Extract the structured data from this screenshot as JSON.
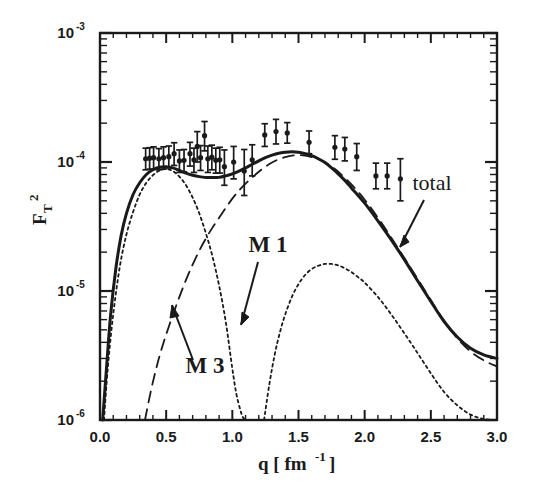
{
  "figure": {
    "background": "#ffffff",
    "ink_color": "#1a1a1a"
  },
  "axes": {
    "x_title_q": "q [ fm",
    "x_title_exp": "-1",
    "x_title_close": "]",
    "y_title_base": "F",
    "y_title_sub": "T",
    "y_title_sup": "2",
    "x_ticks": [
      "0.0",
      "0.5",
      "1.0",
      "1.5",
      "2.0",
      "2.5",
      "3.0"
    ],
    "y_ticks": [
      {
        "mantissa": "10",
        "exponent": "-3"
      },
      {
        "mantissa": "10",
        "exponent": "-4"
      },
      {
        "mantissa": "10",
        "exponent": "-5"
      },
      {
        "mantissa": "10",
        "exponent": "-6"
      }
    ]
  },
  "annotations": {
    "total": "total",
    "m1": "M 1",
    "m3": "M 3"
  },
  "chart_data": {
    "type": "line",
    "title": "",
    "xlabel": "q [ fm^-1 ]",
    "ylabel": "F_T^2",
    "xlim": [
      0.0,
      3.0
    ],
    "ylim": [
      1e-06,
      0.001
    ],
    "yscale": "log",
    "xscale": "linear",
    "grid": false,
    "legend": "inline-annotations",
    "annotations": [
      {
        "text": "total",
        "points_to_series": "total",
        "x": 2.62,
        "y": 3.2e-05
      },
      {
        "text": "M 1",
        "points_to_series": "M1",
        "x": 1.22,
        "y": 1.5e-05
      },
      {
        "text": "M 3",
        "points_to_series": "M3",
        "x": 0.62,
        "y": 3e-06
      }
    ],
    "series": [
      {
        "name": "total",
        "style": "solid",
        "linewidth": 3,
        "x": [
          0.02,
          0.05,
          0.08,
          0.12,
          0.16,
          0.2,
          0.25,
          0.3,
          0.35,
          0.4,
          0.45,
          0.5,
          0.55,
          0.6,
          0.65,
          0.7,
          0.75,
          0.8,
          0.85,
          0.9,
          0.95,
          1.0,
          1.05,
          1.1,
          1.15,
          1.2,
          1.25,
          1.3,
          1.35,
          1.4,
          1.45,
          1.5,
          1.55,
          1.6,
          1.65,
          1.7,
          1.75,
          1.8,
          1.85,
          1.9,
          2.0,
          2.1,
          2.2,
          2.3,
          2.4,
          2.5,
          2.6,
          2.7,
          2.8,
          2.9,
          3.0
        ],
        "y": [
          1e-06,
          2.6e-06,
          6.5e-06,
          1.5e-05,
          2.7e-05,
          4e-05,
          5.6e-05,
          6.9e-05,
          8e-05,
          8.7e-05,
          9.1e-05,
          9.2e-05,
          9e-05,
          8.6e-05,
          8.2e-05,
          7.9e-05,
          7.7e-05,
          7.6e-05,
          7.6e-05,
          7.6e-05,
          7.8e-05,
          8.1e-05,
          8.5e-05,
          9e-05,
          9.6e-05,
          0.000102,
          0.000108,
          0.000113,
          0.000117,
          0.000119,
          0.00012,
          0.000119,
          0.000116,
          0.000112,
          0.000106,
          9.9e-05,
          9e-05,
          8.1e-05,
          7.2e-05,
          6.3e-05,
          4.8e-05,
          3.5e-05,
          2.5e-05,
          1.75e-05,
          1.2e-05,
          8.3e-06,
          5.8e-06,
          4.4e-06,
          3.6e-06,
          3.2e-06,
          3e-06
        ]
      },
      {
        "name": "M3",
        "style": "dashed",
        "linewidth": 1.8,
        "x": [
          0.34,
          0.38,
          0.42,
          0.46,
          0.5,
          0.55,
          0.6,
          0.65,
          0.7,
          0.75,
          0.8,
          0.85,
          0.9,
          0.95,
          1.0,
          1.05,
          1.1,
          1.15,
          1.2,
          1.25,
          1.3,
          1.35,
          1.4,
          1.45,
          1.5,
          1.55,
          1.6,
          1.65,
          1.7,
          1.75,
          1.8,
          1.9,
          2.0,
          2.1,
          2.2,
          2.3,
          2.4,
          2.5,
          2.6,
          2.7,
          2.8,
          2.9,
          3.0
        ],
        "y": [
          1e-06,
          1.6e-06,
          2.4e-06,
          3.4e-06,
          4.6e-06,
          6.5e-06,
          9e-06,
          1.22e-05,
          1.6e-05,
          2.05e-05,
          2.55e-05,
          3.1e-05,
          3.7e-05,
          4.4e-05,
          5.2e-05,
          6e-05,
          6.8e-05,
          7.6e-05,
          8.4e-05,
          9.2e-05,
          9.9e-05,
          0.000105,
          0.000109,
          0.000112,
          0.000113,
          0.000112,
          0.000109,
          0.000105,
          9.9e-05,
          9.2e-05,
          8.4e-05,
          6.7e-05,
          5.1e-05,
          3.7e-05,
          2.6e-05,
          1.8e-05,
          1.24e-05,
          8.5e-06,
          5.9e-06,
          4.3e-06,
          3.4e-06,
          2.9e-06,
          2.6e-06
        ]
      },
      {
        "name": "M1",
        "style": "dotted",
        "linewidth": 1.8,
        "segments": [
          {
            "x": [
              0.03,
              0.06,
              0.1,
              0.15,
              0.2,
              0.25,
              0.3,
              0.35,
              0.4,
              0.45,
              0.5,
              0.55,
              0.6,
              0.65,
              0.7,
              0.75,
              0.8,
              0.85,
              0.9,
              0.95,
              1.0,
              1.03,
              1.06,
              1.08,
              1.1
            ],
            "y": [
              1e-06,
              2.6e-06,
              6.6e-06,
              1.55e-05,
              2.75e-05,
              4.1e-05,
              5.6e-05,
              6.9e-05,
              7.9e-05,
              8.6e-05,
              8.8e-05,
              8.5e-05,
              7.7e-05,
              6.6e-05,
              5.3e-05,
              4e-05,
              2.8e-05,
              1.85e-05,
              1.1e-05,
              5.8e-06,
              2.5e-06,
              1.6e-06,
              1.2e-06,
              1.05e-06,
              1e-06
            ]
          },
          {
            "x": [
              1.24,
              1.28,
              1.32,
              1.36,
              1.4,
              1.45,
              1.5,
              1.55,
              1.6,
              1.65,
              1.7,
              1.75,
              1.8,
              1.85,
              1.9,
              1.95,
              2.0,
              2.1,
              2.2,
              2.3,
              2.4,
              2.5,
              2.6,
              2.7,
              2.8,
              2.9,
              3.0
            ],
            "y": [
              1e-06,
              1.9e-06,
              3.2e-06,
              4.8e-06,
              6.6e-06,
              9e-06,
              1.13e-05,
              1.33e-05,
              1.48e-05,
              1.57e-05,
              1.62e-05,
              1.62e-05,
              1.58e-05,
              1.5e-05,
              1.4e-05,
              1.28e-05,
              1.16e-05,
              9e-06,
              6.6e-06,
              4.7e-06,
              3.3e-06,
              2.3e-06,
              1.65e-06,
              1.3e-06,
              1.1e-06,
              1.02e-06,
              1e-06
            ]
          }
        ]
      }
    ],
    "data_points": {
      "name": "experimental data",
      "marker": "filled-circle-with-errorbars",
      "points": [
        {
          "x": 0.345,
          "y": 0.000106,
          "yerr_lo": 1.9e-05,
          "yerr_hi": 2.2e-05
        },
        {
          "x": 0.375,
          "y": 0.000107,
          "yerr_lo": 1.9e-05,
          "yerr_hi": 2.2e-05
        },
        {
          "x": 0.405,
          "y": 0.000108,
          "yerr_lo": 2e-05,
          "yerr_hi": 2.3e-05
        },
        {
          "x": 0.445,
          "y": 0.000106,
          "yerr_lo": 1.9e-05,
          "yerr_hi": 2.1e-05
        },
        {
          "x": 0.48,
          "y": 0.000108,
          "yerr_lo": 2e-05,
          "yerr_hi": 2.3e-05
        },
        {
          "x": 0.52,
          "y": 0.00011,
          "yerr_lo": 2e-05,
          "yerr_hi": 2.3e-05
        },
        {
          "x": 0.56,
          "y": 0.000116,
          "yerr_lo": 2.2e-05,
          "yerr_hi": 2.5e-05
        },
        {
          "x": 0.6,
          "y": 0.000102,
          "yerr_lo": 1.9e-05,
          "yerr_hi": 2.2e-05
        },
        {
          "x": 0.635,
          "y": 0.000103,
          "yerr_lo": 1.9e-05,
          "yerr_hi": 2.2e-05
        },
        {
          "x": 0.68,
          "y": 0.000116,
          "yerr_lo": 2.3e-05,
          "yerr_hi": 2.6e-05
        },
        {
          "x": 0.71,
          "y": 0.000104,
          "yerr_lo": 2.1e-05,
          "yerr_hi": 2.4e-05
        },
        {
          "x": 0.735,
          "y": 0.000132,
          "yerr_lo": 3.2e-05,
          "yerr_hi": 4e-05
        },
        {
          "x": 0.76,
          "y": 0.000108,
          "yerr_lo": 2.2e-05,
          "yerr_hi": 2.6e-05
        },
        {
          "x": 0.79,
          "y": 0.00016,
          "yerr_lo": 3.8e-05,
          "yerr_hi": 4.6e-05
        },
        {
          "x": 0.815,
          "y": 0.000106,
          "yerr_lo": 2.3e-05,
          "yerr_hi": 2.7e-05
        },
        {
          "x": 0.845,
          "y": 0.000109,
          "yerr_lo": 2.2e-05,
          "yerr_hi": 2.6e-05
        },
        {
          "x": 0.875,
          "y": 0.000103,
          "yerr_lo": 2.1e-05,
          "yerr_hi": 2.5e-05
        },
        {
          "x": 0.905,
          "y": 0.000104,
          "yerr_lo": 2.2e-05,
          "yerr_hi": 2.6e-05
        },
        {
          "x": 0.94,
          "y": 9.2e-05,
          "yerr_lo": 2.6e-05,
          "yerr_hi": 3.2e-05
        },
        {
          "x": 1.01,
          "y": 0.0001,
          "yerr_lo": 2.6e-05,
          "yerr_hi": 3.2e-05
        },
        {
          "x": 1.09,
          "y": 8.5e-05,
          "yerr_lo": 3e-05,
          "yerr_hi": 4e-05
        },
        {
          "x": 1.15,
          "y": 0.000104,
          "yerr_lo": 2.6e-05,
          "yerr_hi": 3.2e-05
        },
        {
          "x": 1.245,
          "y": 0.000162,
          "yerr_lo": 3e-05,
          "yerr_hi": 3.6e-05
        },
        {
          "x": 1.33,
          "y": 0.000172,
          "yerr_lo": 3.4e-05,
          "yerr_hi": 4.2e-05
        },
        {
          "x": 1.415,
          "y": 0.000168,
          "yerr_lo": 2.8e-05,
          "yerr_hi": 3.4e-05
        },
        {
          "x": 1.58,
          "y": 0.000142,
          "yerr_lo": 2.6e-05,
          "yerr_hi": 3.2e-05
        },
        {
          "x": 1.775,
          "y": 0.00013,
          "yerr_lo": 2.5e-05,
          "yerr_hi": 3e-05
        },
        {
          "x": 1.85,
          "y": 0.000126,
          "yerr_lo": 2.4e-05,
          "yerr_hi": 2.9e-05
        },
        {
          "x": 1.94,
          "y": 0.00011,
          "yerr_lo": 2.4e-05,
          "yerr_hi": 2.9e-05
        },
        {
          "x": 2.085,
          "y": 7.8e-05,
          "yerr_lo": 1.6e-05,
          "yerr_hi": 2e-05
        },
        {
          "x": 2.17,
          "y": 7.8e-05,
          "yerr_lo": 1.6e-05,
          "yerr_hi": 2e-05
        },
        {
          "x": 2.27,
          "y": 7.4e-05,
          "yerr_lo": 2.4e-05,
          "yerr_hi": 3.2e-05
        }
      ]
    }
  }
}
